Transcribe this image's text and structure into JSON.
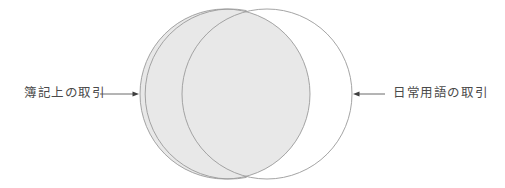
{
  "figure": {
    "type": "venn-diagram",
    "background_color": "#ffffff",
    "stroke_color": "#9a9a9a",
    "shaded_fill_color": "#e8e8e8",
    "unshaded_fill_color": "#ffffff",
    "text_color": "#4a4a4a"
  },
  "sets": [
    {
      "id": "bookkeeping",
      "label": "簿記上の取引",
      "shaded": true,
      "center_x": 225,
      "center_y": 94,
      "radius": 85
    },
    {
      "id": "everyday-language",
      "label": "日常用語の取引",
      "shaded": false,
      "center_x": 267,
      "center_y": 94,
      "radius": 85
    }
  ],
  "annotations": {
    "left": {
      "label": "簿記上の取引",
      "arrow_direction": "right",
      "arrow_x_start": 100,
      "arrow_x_end": 139,
      "arrow_y": 94
    },
    "right": {
      "label": "日常用語の取引",
      "arrow_direction": "left",
      "arrow_x_start": 385,
      "arrow_x_end": 353,
      "arrow_y": 94
    }
  }
}
